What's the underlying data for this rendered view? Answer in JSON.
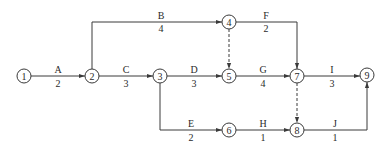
{
  "diagram": {
    "type": "activity-on-arrow network",
    "nodes": [
      {
        "id": "1",
        "label": "1",
        "x": 24,
        "y": 76
      },
      {
        "id": "2",
        "label": "2",
        "x": 92,
        "y": 76
      },
      {
        "id": "3",
        "label": "3",
        "x": 160,
        "y": 76
      },
      {
        "id": "4",
        "label": "4",
        "x": 229,
        "y": 22
      },
      {
        "id": "5",
        "label": "5",
        "x": 229,
        "y": 76
      },
      {
        "id": "6",
        "label": "6",
        "x": 229,
        "y": 130
      },
      {
        "id": "7",
        "label": "7",
        "x": 297,
        "y": 76
      },
      {
        "id": "8",
        "label": "8",
        "x": 297,
        "y": 130
      },
      {
        "id": "9",
        "label": "9",
        "x": 367,
        "y": 75
      }
    ],
    "activities": [
      {
        "name": "A",
        "duration": "2",
        "from": "1",
        "to": "2"
      },
      {
        "name": "B",
        "duration": "4",
        "from": "2",
        "to": "4"
      },
      {
        "name": "C",
        "duration": "3",
        "from": "2",
        "to": "3"
      },
      {
        "name": "D",
        "duration": "3",
        "from": "3",
        "to": "5"
      },
      {
        "name": "E",
        "duration": "2",
        "from": "3",
        "to": "6"
      },
      {
        "name": "F",
        "duration": "2",
        "from": "4",
        "to": "7"
      },
      {
        "name": "G",
        "duration": "4",
        "from": "5",
        "to": "7"
      },
      {
        "name": "H",
        "duration": "1",
        "from": "6",
        "to": "8"
      },
      {
        "name": "I",
        "duration": "3",
        "from": "7",
        "to": "9"
      },
      {
        "name": "J",
        "duration": "1",
        "from": "8",
        "to": "9"
      }
    ],
    "dummies": [
      {
        "from": "4",
        "to": "5"
      },
      {
        "from": "7",
        "to": "8"
      }
    ],
    "colors": {
      "line": "#3a3a3a",
      "text": "#2a2a2a",
      "background": "#ffffff"
    }
  }
}
